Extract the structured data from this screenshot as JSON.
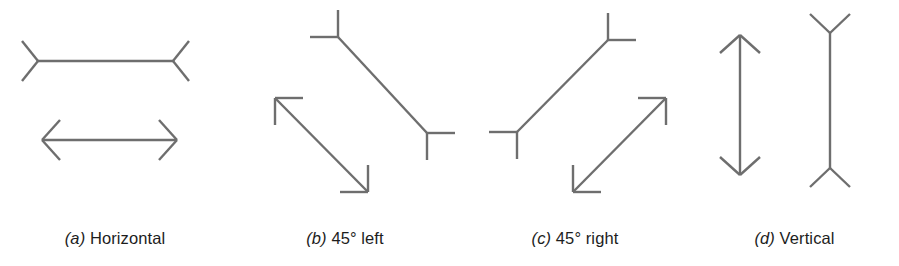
{
  "figure": {
    "background_color": "#ffffff",
    "stroke_color": "#6e6e6e",
    "text_color": "#1d1d1d",
    "stroke_width": 2.4
  },
  "panels": [
    {
      "id": "a",
      "caption_index": "(a)",
      "caption_text": "Horizontal",
      "orientation": "horizontal",
      "stimuli": [
        {
          "name": "fins-out-wings",
          "shaft": {
            "x1": 38,
            "y1": 61,
            "x2": 173,
            "y2": 61
          },
          "fins": [
            {
              "x1": 22,
              "y1": 41,
              "x2": 38,
              "y2": 61
            },
            {
              "x1": 22,
              "y1": 81,
              "x2": 38,
              "y2": 61
            },
            {
              "x1": 189,
              "y1": 41,
              "x2": 173,
              "y2": 61
            },
            {
              "x1": 189,
              "y1": 81,
              "x2": 173,
              "y2": 61
            }
          ]
        },
        {
          "name": "fins-in-arrows",
          "shaft": {
            "x1": 42,
            "y1": 140,
            "x2": 177,
            "y2": 140
          },
          "fins": [
            {
              "x1": 60,
              "y1": 120,
              "x2": 42,
              "y2": 140
            },
            {
              "x1": 60,
              "y1": 160,
              "x2": 42,
              "y2": 140
            },
            {
              "x1": 159,
              "y1": 120,
              "x2": 177,
              "y2": 140
            },
            {
              "x1": 159,
              "y1": 160,
              "x2": 177,
              "y2": 140
            }
          ]
        }
      ]
    },
    {
      "id": "b",
      "caption_index": "(b)",
      "caption_text": "45° left",
      "orientation": "45-degrees-left",
      "stimuli": [
        {
          "name": "fins-out-wings",
          "shaft": {
            "x1": 108,
            "y1": 37,
            "x2": 197,
            "y2": 133
          },
          "fins": [
            {
              "x1": 108,
              "y1": 10,
              "x2": 108,
              "y2": 37
            },
            {
              "x1": 80,
              "y1": 37,
              "x2": 108,
              "y2": 37
            },
            {
              "x1": 197,
              "y1": 160,
              "x2": 197,
              "y2": 133
            },
            {
              "x1": 225,
              "y1": 133,
              "x2": 197,
              "y2": 133
            }
          ]
        },
        {
          "name": "fins-in-arrows",
          "shaft": {
            "x1": 45,
            "y1": 98,
            "x2": 138,
            "y2": 192
          },
          "fins": [
            {
              "x1": 45,
              "y1": 125,
              "x2": 45,
              "y2": 98
            },
            {
              "x1": 73,
              "y1": 98,
              "x2": 45,
              "y2": 98
            },
            {
              "x1": 138,
              "y1": 165,
              "x2": 138,
              "y2": 192
            },
            {
              "x1": 110,
              "y1": 192,
              "x2": 138,
              "y2": 192
            }
          ]
        }
      ]
    },
    {
      "id": "c",
      "caption_index": "(c)",
      "caption_text": "45° right",
      "orientation": "45-degrees-right",
      "stimuli": [
        {
          "name": "fins-out-wings",
          "shaft": {
            "x1": 57,
            "y1": 132,
            "x2": 148,
            "y2": 40
          },
          "fins": [
            {
              "x1": 57,
              "y1": 159,
              "x2": 57,
              "y2": 132
            },
            {
              "x1": 29,
              "y1": 132,
              "x2": 57,
              "y2": 132
            },
            {
              "x1": 148,
              "y1": 13,
              "x2": 148,
              "y2": 40
            },
            {
              "x1": 176,
              "y1": 40,
              "x2": 148,
              "y2": 40
            }
          ]
        },
        {
          "name": "fins-in-arrows",
          "shaft": {
            "x1": 113,
            "y1": 192,
            "x2": 206,
            "y2": 98
          },
          "fins": [
            {
              "x1": 113,
              "y1": 165,
              "x2": 113,
              "y2": 192
            },
            {
              "x1": 141,
              "y1": 192,
              "x2": 113,
              "y2": 192
            },
            {
              "x1": 206,
              "y1": 125,
              "x2": 206,
              "y2": 98
            },
            {
              "x1": 178,
              "y1": 98,
              "x2": 206,
              "y2": 98
            }
          ]
        }
      ]
    },
    {
      "id": "d",
      "caption_index": "(d)",
      "caption_text": "Vertical",
      "orientation": "vertical",
      "stimuli": [
        {
          "name": "fins-in-arrows",
          "shaft": {
            "x1": 50,
            "y1": 35,
            "x2": 50,
            "y2": 175
          },
          "fins": [
            {
              "x1": 30,
              "y1": 53,
              "x2": 50,
              "y2": 35
            },
            {
              "x1": 70,
              "y1": 53,
              "x2": 50,
              "y2": 35
            },
            {
              "x1": 30,
              "y1": 157,
              "x2": 50,
              "y2": 175
            },
            {
              "x1": 70,
              "y1": 157,
              "x2": 50,
              "y2": 175
            }
          ]
        },
        {
          "name": "fins-out-wings",
          "shaft": {
            "x1": 140,
            "y1": 33,
            "x2": 140,
            "y2": 168
          },
          "fins": [
            {
              "x1": 120,
              "y1": 14,
              "x2": 140,
              "y2": 33
            },
            {
              "x1": 160,
              "y1": 14,
              "x2": 140,
              "y2": 33
            },
            {
              "x1": 120,
              "y1": 187,
              "x2": 140,
              "y2": 168
            },
            {
              "x1": 160,
              "y1": 187,
              "x2": 140,
              "y2": 168
            }
          ]
        }
      ]
    }
  ]
}
